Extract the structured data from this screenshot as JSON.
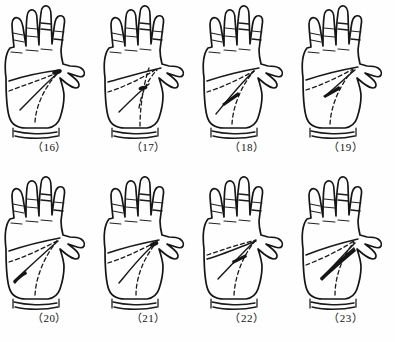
{
  "sheet": {
    "title": "Palm crease pattern figure plate",
    "background_color": "#fefefe",
    "ink_color": "#151515",
    "columns": 4,
    "rows": 2,
    "total_figures": 8
  },
  "figures": [
    {
      "number": "16",
      "caption": "（16）",
      "row": 1,
      "column": 1,
      "hand": "right palm",
      "description": "Palm with solid distal transverse crease running across, dashed proximal crease descending to wrist, and a small dark teardrop mark at the base of the index finger",
      "marks": {
        "solid_lines": 2,
        "dashed_lines": 2,
        "dark_blob": "index-base"
      }
    },
    {
      "number": "17",
      "caption": "（17）",
      "row": 1,
      "column": 2,
      "hand": "right palm",
      "description": "Palm with dashed crease sweeping from ulnar border, a long vertical dashed line toward the wrist and a short dark blob mid-palm",
      "marks": {
        "solid_lines": 2,
        "dashed_lines": 3,
        "dark_blob": "mid-palm"
      }
    },
    {
      "number": "18",
      "caption": "（18）",
      "row": 1,
      "column": 3,
      "hand": "right palm",
      "description": "Palm with two converging solid creases meeting near centre, dashed proximal crease and a slender dark spindle mark mid-palm",
      "marks": {
        "solid_lines": 2,
        "dashed_lines": 2,
        "dark_blob": "mid-palm-spindle"
      }
    },
    {
      "number": "19",
      "caption": "（19）",
      "row": 1,
      "column": 4,
      "hand": "right palm",
      "description": "Palm with solid crease from the thenar web, dashed proximal crease and a tapered dark spindle mark pointing toward the index base",
      "marks": {
        "solid_lines": 2,
        "dashed_lines": 2,
        "dark_blob": "upper-mid-palm-spindle"
      }
    },
    {
      "number": "20",
      "caption": "（20）",
      "row": 2,
      "column": 1,
      "hand": "right palm",
      "description": "Palm with long solid crease reaching the ulnar border ending in a narrow dark leaf mark, plus dashed proximal crease to the wrist",
      "marks": {
        "solid_lines": 2,
        "dashed_lines": 2,
        "dark_blob": "ulnar-border-leaf"
      }
    },
    {
      "number": "21",
      "caption": "（21）",
      "row": 2,
      "column": 2,
      "hand": "right palm",
      "description": "Palm with solid crease curving down from the thumb web and dashed line descending to wrist, small dark blob near the index base",
      "marks": {
        "solid_lines": 2,
        "dashed_lines": 2,
        "dark_blob": "index-base"
      }
    },
    {
      "number": "22",
      "caption": "（22）",
      "row": 2,
      "column": 3,
      "hand": "right palm",
      "description": "Palm with dashed crease across the upper palm, solid crease descending left and a short dark spindle mark at the crease junction",
      "marks": {
        "solid_lines": 2,
        "dashed_lines": 2,
        "dark_blob": "crease-junction"
      }
    },
    {
      "number": "23",
      "caption": "（23）",
      "row": 2,
      "column": 4,
      "hand": "right palm",
      "description": "Palm with a prominent thick dark streak angling from the index base down toward the centre, dashed proximal crease to the wrist",
      "marks": {
        "solid_lines": 2,
        "dashed_lines": 2,
        "dark_blob": "long-diagonal-streak"
      }
    }
  ]
}
